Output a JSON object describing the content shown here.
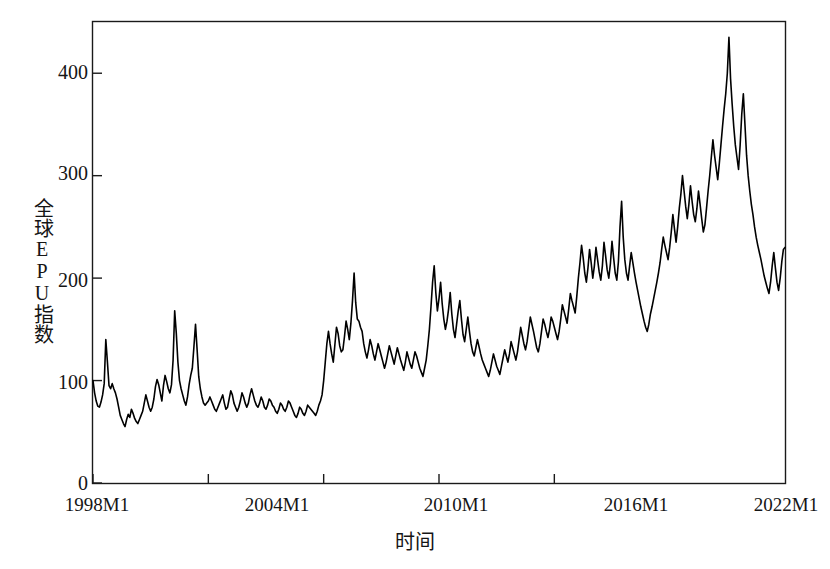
{
  "chart_data": {
    "type": "line",
    "title": "",
    "xlabel": "时间",
    "ylabel": "全球EPU指数",
    "ylim": [
      0,
      450
    ],
    "yticks": [
      0,
      100,
      200,
      300,
      400
    ],
    "ytick_labels": [
      "0",
      "100",
      "200",
      "300",
      "400"
    ],
    "xtick_labels": [
      "1998M1",
      "2004M1",
      "2010M1",
      "2016M1",
      "2022M1"
    ],
    "xtick_values": [
      "1998M1",
      "2004M1",
      "2010M1",
      "2016M1",
      "2022M1"
    ],
    "x_start": "1998M1",
    "x_end": "2022M1",
    "frequency": "monthly",
    "grid": false,
    "legend": null,
    "series": [
      {
        "name": "全球EPU指数",
        "color": "#000000",
        "line_width": 1.6,
        "values": [
          100,
          88,
          80,
          75,
          74,
          79,
          86,
          97,
          140,
          118,
          95,
          92,
          97,
          92,
          88,
          82,
          74,
          66,
          62,
          58,
          55,
          62,
          67,
          64,
          72,
          68,
          63,
          60,
          58,
          62,
          66,
          70,
          78,
          86,
          80,
          74,
          70,
          74,
          82,
          94,
          101,
          96,
          88,
          80,
          95,
          105,
          99,
          92,
          88,
          96,
          120,
          168,
          146,
          118,
          100,
          92,
          86,
          80,
          76,
          84,
          96,
          105,
          112,
          133,
          155,
          130,
          104,
          92,
          84,
          78,
          76,
          78,
          80,
          84,
          80,
          76,
          72,
          70,
          74,
          78,
          82,
          86,
          78,
          72,
          74,
          82,
          90,
          86,
          78,
          74,
          70,
          74,
          80,
          88,
          84,
          78,
          74,
          78,
          86,
          92,
          86,
          80,
          76,
          74,
          78,
          84,
          80,
          74,
          72,
          76,
          82,
          80,
          76,
          74,
          70,
          68,
          72,
          78,
          76,
          72,
          70,
          74,
          80,
          78,
          74,
          70,
          66,
          64,
          68,
          74,
          72,
          68,
          66,
          70,
          76,
          74,
          72,
          70,
          68,
          66,
          70,
          76,
          80,
          86,
          100,
          118,
          136,
          148,
          136,
          126,
          118,
          135,
          152,
          146,
          134,
          128,
          130,
          143,
          158,
          150,
          140,
          156,
          178,
          205,
          176,
          160,
          158,
          152,
          148,
          136,
          128,
          122,
          130,
          140,
          134,
          126,
          120,
          128,
          136,
          130,
          124,
          118,
          112,
          118,
          126,
          134,
          128,
          122,
          116,
          124,
          132,
          126,
          120,
          115,
          110,
          118,
          128,
          122,
          116,
          112,
          120,
          128,
          124,
          118,
          112,
          108,
          104,
          112,
          120,
          134,
          150,
          172,
          196,
          212,
          186,
          168,
          180,
          196,
          175,
          160,
          150,
          158,
          170,
          186,
          165,
          150,
          142,
          155,
          168,
          178,
          160,
          145,
          138,
          150,
          162,
          148,
          136,
          128,
          124,
          132,
          140,
          133,
          126,
          120,
          116,
          112,
          108,
          104,
          110,
          118,
          126,
          120,
          114,
          110,
          106,
          114,
          122,
          130,
          124,
          118,
          126,
          138,
          132,
          126,
          120,
          128,
          140,
          152,
          144,
          136,
          130,
          138,
          150,
          162,
          155,
          148,
          140,
          132,
          128,
          136,
          148,
          160,
          155,
          148,
          142,
          150,
          162,
          158,
          152,
          146,
          140,
          148,
          160,
          174,
          168,
          162,
          156,
          170,
          185,
          178,
          172,
          166,
          182,
          200,
          215,
          232,
          220,
          205,
          196,
          210,
          228,
          215,
          200,
          212,
          230,
          218,
          206,
          198,
          212,
          235,
          222,
          208,
          200,
          214,
          236,
          220,
          205,
          198,
          216,
          250,
          275,
          240,
          218,
          205,
          198,
          212,
          225,
          215,
          205,
          196,
          188,
          180,
          172,
          165,
          158,
          152,
          148,
          155,
          165,
          172,
          180,
          188,
          196,
          205,
          215,
          228,
          240,
          232,
          225,
          218,
          230,
          245,
          262,
          248,
          235,
          250,
          268,
          282,
          300,
          285,
          270,
          258,
          272,
          290,
          275,
          262,
          255,
          268,
          285,
          272,
          258,
          245,
          252,
          268,
          285,
          300,
          318,
          335,
          320,
          308,
          296,
          312,
          330,
          348,
          365,
          380,
          400,
          435,
          395,
          370,
          348,
          330,
          318,
          306,
          330,
          360,
          380,
          350,
          320,
          300,
          285,
          272,
          262,
          250,
          240,
          232,
          225,
          218,
          210,
          202,
          196,
          190,
          185,
          196,
          212,
          225,
          210,
          196,
          188,
          200,
          216,
          228,
          230
        ]
      }
    ],
    "annotations": [
      {
        "label": "1998 Asian financial crisis spike",
        "x": "1998M9",
        "y": 140
      },
      {
        "label": "2003 Iraq war spike",
        "x": "2003M2",
        "y": 155
      },
      {
        "label": "2008 global financial crisis peak",
        "x": "2008M10",
        "y": 205
      },
      {
        "label": "2011-2012 euro debt crisis peak",
        "x": "2011M10",
        "y": 212
      },
      {
        "label": "2017 geopolitical spike",
        "x": "2017M7",
        "y": 275
      },
      {
        "label": "2020 COVID-19 record peak",
        "x": "2020M5",
        "y": 435
      }
    ]
  },
  "axes": {
    "frame_color": "#1a1a1a",
    "line_color": "#000000",
    "background": "#ffffff"
  }
}
